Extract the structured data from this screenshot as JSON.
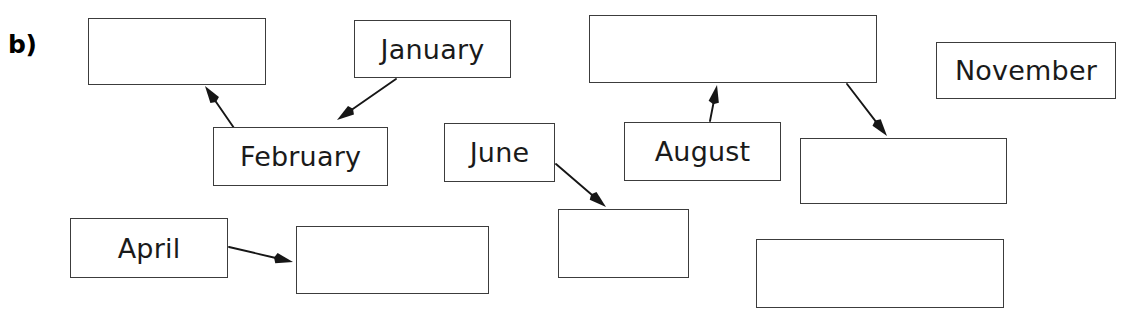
{
  "figure": {
    "part_label": "b)",
    "stroke_color": "#3c3c3c",
    "text_color": "#1a1a1a",
    "background_color": "#ffffff",
    "width": 1135,
    "height": 313
  },
  "nodes": [
    {
      "id": "box-blank-top-left",
      "label": "",
      "empty": true,
      "x": 88,
      "y": 18,
      "w": 178,
      "h": 67
    },
    {
      "id": "box-january",
      "label": "January",
      "empty": false,
      "x": 354,
      "y": 20,
      "w": 157,
      "h": 58
    },
    {
      "id": "box-blank-top-center",
      "label": "",
      "empty": true,
      "x": 589,
      "y": 15,
      "w": 288,
      "h": 68
    },
    {
      "id": "box-november",
      "label": "November",
      "empty": false,
      "x": 936,
      "y": 42,
      "w": 180,
      "h": 57
    },
    {
      "id": "box-february",
      "label": "February",
      "empty": false,
      "x": 213,
      "y": 127,
      "w": 175,
      "h": 59
    },
    {
      "id": "box-june",
      "label": "June",
      "empty": false,
      "x": 444,
      "y": 123,
      "w": 111,
      "h": 59
    },
    {
      "id": "box-august",
      "label": "August",
      "empty": false,
      "x": 624,
      "y": 122,
      "w": 157,
      "h": 59
    },
    {
      "id": "box-blank-mid-right",
      "label": "",
      "empty": true,
      "x": 800,
      "y": 138,
      "w": 207,
      "h": 66
    },
    {
      "id": "box-april",
      "label": "April",
      "empty": false,
      "x": 70,
      "y": 218,
      "w": 158,
      "h": 60
    },
    {
      "id": "box-blank-bottom-left",
      "label": "",
      "empty": true,
      "x": 296,
      "y": 226,
      "w": 193,
      "h": 68
    },
    {
      "id": "box-blank-bottom-mid",
      "label": "",
      "empty": true,
      "x": 558,
      "y": 209,
      "w": 131,
      "h": 69
    },
    {
      "id": "box-blank-bottom-right",
      "label": "",
      "empty": true,
      "x": 756,
      "y": 239,
      "w": 248,
      "h": 69
    }
  ],
  "arrows": [
    {
      "id": "arrow-february-to-blank-top-left",
      "from": "box-february",
      "to": "box-blank-top-left",
      "x1": 234,
      "y1": 128,
      "x2": 205,
      "y2": 86
    },
    {
      "id": "arrow-january-to-february",
      "from": "box-january",
      "to": "box-february",
      "x1": 396,
      "y1": 79,
      "x2": 337,
      "y2": 120
    },
    {
      "id": "arrow-june-to-blank-bottom-mid",
      "from": "box-june",
      "to": "box-blank-bottom-mid",
      "x1": 556,
      "y1": 164,
      "x2": 606,
      "y2": 207
    },
    {
      "id": "arrow-august-to-blank-top-center",
      "from": "box-august",
      "to": "box-blank-top-center",
      "x1": 710,
      "y1": 121,
      "x2": 717,
      "y2": 85
    },
    {
      "id": "arrow-blank-top-center-to-mid-right",
      "from": "box-blank-top-center",
      "to": "box-blank-mid-right",
      "x1": 847,
      "y1": 84,
      "x2": 887,
      "y2": 136
    },
    {
      "id": "arrow-april-to-blank-bottom-left",
      "from": "box-april",
      "to": "box-blank-bottom-left",
      "x1": 229,
      "y1": 247,
      "x2": 293,
      "y2": 262
    }
  ]
}
